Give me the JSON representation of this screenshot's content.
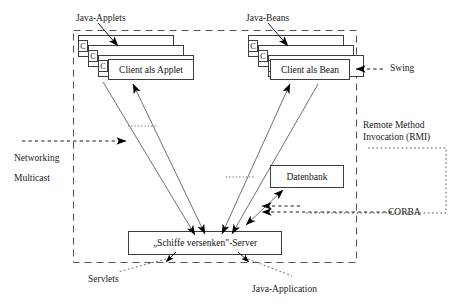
{
  "diagram": {
    "colors": {
      "stroke": "#3d3d3d",
      "arrow": "#000000",
      "dashed_boundary": "#555555",
      "text": "#111111",
      "background": "#ffffff"
    },
    "top_labels": {
      "applets": "Java-Applets",
      "beans": "Java-Beans"
    },
    "side_labels": {
      "swing": "Swing",
      "rmi": "Remote Method\nInvocation (RMI)",
      "rmi_line1": "Remote Method",
      "rmi_line2": "Invocation (RMI)",
      "corba": "CORBA",
      "networking": "Networking",
      "multicast": "Multicast"
    },
    "bottom_labels": {
      "servlets": "Servlets",
      "java_application": "Java-Application"
    },
    "nodes": {
      "client_applet": "Client als Applet",
      "client_bean": "Client als Bean",
      "database": "Datenbank",
      "server": "„Schiffe versenken\"-Server"
    },
    "stack_badges": {
      "badge_label": "C",
      "applet_count": 3,
      "bean_count": 3
    },
    "regions": {
      "inner_dashed_box": "application boundary",
      "corba_dotted_box": "CORBA region"
    }
  }
}
